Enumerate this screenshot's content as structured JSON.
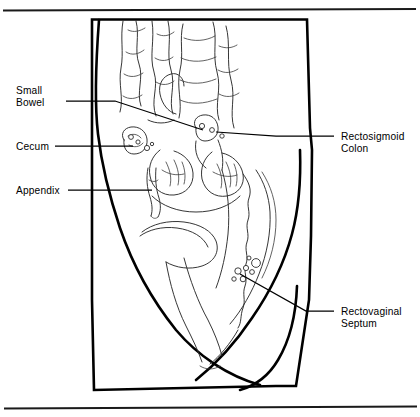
{
  "figure": {
    "type": "medical-illustration",
    "view": "sagittal-section-female-pelvis",
    "line_color": "#000000",
    "background_color": "#ffffff",
    "top_rule": true,
    "bottom_rule": true
  },
  "labels": {
    "small_bowel": "Small\nBowel",
    "small_bowel_line1": "Small",
    "small_bowel_line2": "Bowel",
    "cecum": "Cecum",
    "appendix": "Appendix",
    "rectosigmoid_line1": "Rectosigmoid",
    "rectosigmoid_line2": "Colon",
    "rectovaginal_line1": "Rectovaginal",
    "rectovaginal_line2": "Septum"
  },
  "structures": [
    "small bowel loops",
    "cecum",
    "appendix",
    "rectosigmoid colon",
    "rectovaginal septum",
    "sacrum",
    "uterus",
    "bladder",
    "abdominal wall",
    "endometriosis implants"
  ]
}
